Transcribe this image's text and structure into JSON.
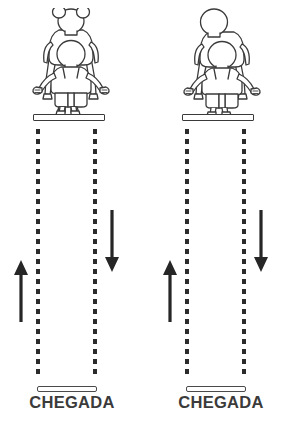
{
  "scene": {
    "title": "Duas raias de corrida com adulto carregando crianca nos ombros",
    "background_color": "#ffffff",
    "line_color": "#2b2b2b",
    "figure_outline_color": "#3a3a3a",
    "label_color": "#3b3b3b",
    "width": 288,
    "height": 424
  },
  "lanes": [
    {
      "id": "left",
      "figure": {
        "name": "adult-carrying-child-left",
        "adult": "parent-standing",
        "child": "child-on-shoulders-with-buns",
        "child_hair": "two-buns"
      },
      "start_bar": {
        "name": "start-line-bar",
        "label": ""
      },
      "lane_lines": [
        {
          "name": "lane-line-inner",
          "style": "dashed"
        },
        {
          "name": "lane-line-outer",
          "style": "dashed"
        }
      ],
      "arrows": [
        {
          "name": "arrow-up",
          "direction": "up"
        },
        {
          "name": "arrow-down",
          "direction": "down"
        }
      ],
      "finish_bar": {
        "name": "finish-line-bar"
      },
      "finish_label": "CHEGADA"
    },
    {
      "id": "right",
      "figure": {
        "name": "adult-carrying-child-right",
        "adult": "parent-standing",
        "child": "child-on-shoulders-plain",
        "child_hair": "none"
      },
      "start_bar": {
        "name": "start-line-bar",
        "label": ""
      },
      "lane_lines": [
        {
          "name": "lane-line-inner",
          "style": "dashed"
        },
        {
          "name": "lane-line-outer",
          "style": "dashed"
        }
      ],
      "arrows": [
        {
          "name": "arrow-up",
          "direction": "up"
        },
        {
          "name": "arrow-down",
          "direction": "down"
        }
      ],
      "finish_bar": {
        "name": "finish-line-bar"
      },
      "finish_label": "CHEGADA"
    }
  ]
}
